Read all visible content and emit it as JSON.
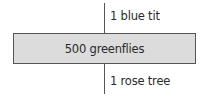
{
  "diagram": {
    "type": "pyramid-of-numbers",
    "levels": [
      {
        "trophic": "secondary consumer",
        "label": "1 blue tit",
        "count": 1,
        "organism": "blue tit"
      },
      {
        "trophic": "primary consumer",
        "label": "500 greenflies",
        "count": 500,
        "organism": "greenflies"
      },
      {
        "trophic": "producer",
        "label": "1 rose tree",
        "count": 1,
        "organism": "rose tree"
      }
    ],
    "colors": {
      "bar_fill": "#dcdcdc",
      "bar_border": "#555555",
      "line": "#555555",
      "text": "#2a2a2a"
    }
  }
}
